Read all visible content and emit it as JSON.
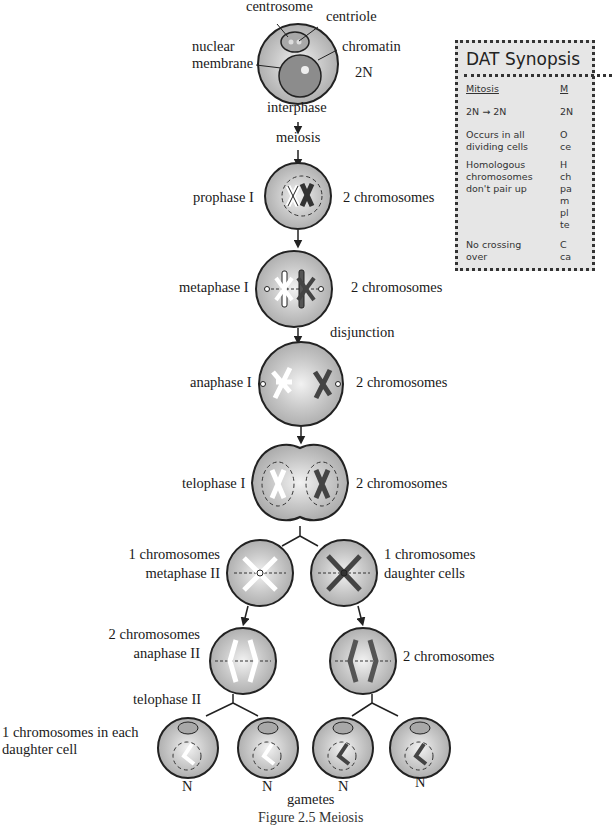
{
  "figure": {
    "caption": "Figure 2.5 Meiosis",
    "stages": {
      "interphase": {
        "title": "interphase",
        "labels": {
          "centrosome": "centrosome",
          "centriole": "centriole",
          "nuclear_membrane": "nuclear\nmembrane",
          "chromatin": "chromatin"
        },
        "ploidy": "2N"
      },
      "meiosis": "meiosis",
      "prophase_1": {
        "title": "prophase I",
        "count": "2 chromosomes"
      },
      "metaphase_1": {
        "title": "metaphase I",
        "count": "2 chromosomes"
      },
      "disjunction": "disjunction",
      "anaphase_1": {
        "title": "anaphase I",
        "count": "2 chromosomes"
      },
      "telophase_1": {
        "title": "telophase I",
        "count": "2 chromosomes"
      },
      "metaphase_2": {
        "title": "metaphase II",
        "count": "1 chromosomes"
      },
      "daughter_cells": {
        "title": "daughter cells",
        "count": "1 chromosomes"
      },
      "anaphase_2_left": {
        "title": "anaphase II",
        "count": "2 chromosomes"
      },
      "anaphase_2_right": {
        "count": "2 chromosomes"
      },
      "telophase_2": {
        "title": "telophase II",
        "note": "1 chromosomes in each\ndaughter cell"
      },
      "gametes": {
        "title": "gametes",
        "ploidy": [
          "N",
          "N",
          "N",
          "N"
        ]
      }
    }
  },
  "synopsis": {
    "title": "DAT Synopsis",
    "columns": [
      {
        "header": "Mitosis",
        "rows": [
          "2N → 2N",
          "Occurs in all\ndividing cells",
          "Homologous\nchromosomes\ndon't pair up",
          "No crossing\nover"
        ]
      },
      {
        "header": "M",
        "rows": [
          "2N",
          "O\nce",
          "H\nch\npa\nm\npl\nte",
          "C\nca"
        ]
      }
    ]
  },
  "colors": {
    "cell_fill": "#b9b9b9",
    "cell_highlight": "#efefef",
    "outline": "#2a2a2a",
    "synopsis_bg": "#e6e6e6"
  }
}
